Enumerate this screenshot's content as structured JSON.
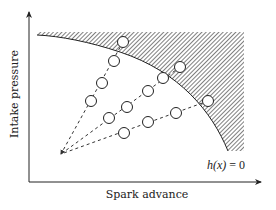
{
  "figure": {
    "type": "feasible-region-diagram",
    "x_axis": {
      "label": "Spark advance"
    },
    "y_axis": {
      "label": "Intake pressure"
    },
    "constraint_label": {
      "func": "h(x)",
      "rel": " = 0"
    },
    "colors": {
      "ink": "#222222",
      "hatch": "#4a4a4a",
      "background": "#ffffff",
      "circle_fill": "#ffffff"
    },
    "rays": [
      {
        "name": "ray-1",
        "points": [
          [
            91,
            101
          ],
          [
            102,
            83
          ],
          [
            114,
            61
          ],
          [
            123,
            42
          ]
        ]
      },
      {
        "name": "ray-2",
        "points": [
          [
            109,
            118
          ],
          [
            127,
            107
          ],
          [
            148,
            91
          ],
          [
            163,
            78
          ],
          [
            180,
            67
          ]
        ]
      },
      {
        "name": "ray-3",
        "points": [
          [
            124,
            133
          ],
          [
            148,
            122
          ],
          [
            176,
            113
          ],
          [
            208,
            101
          ]
        ]
      }
    ],
    "ray_origin": [
      60,
      155
    ]
  }
}
